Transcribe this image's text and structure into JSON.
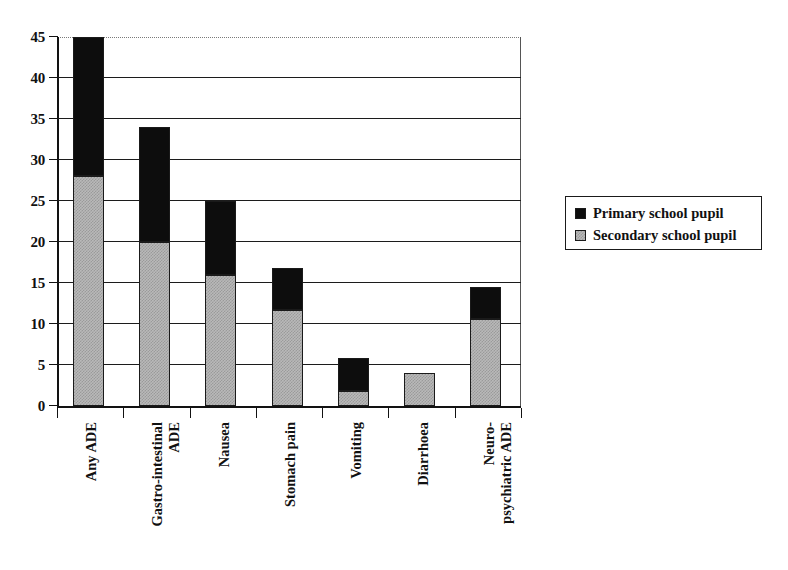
{
  "chart_data": {
    "type": "bar",
    "subtype": "stacked-vertical",
    "title": "",
    "xlabel": "",
    "ylabel": "",
    "ylim": [
      0,
      45
    ],
    "yticks": [
      0,
      5,
      10,
      15,
      20,
      25,
      30,
      35,
      40,
      45
    ],
    "ytick_labels": [
      "0",
      "5",
      "10",
      "15",
      "20",
      "25",
      "30",
      "35",
      "40",
      "45"
    ],
    "grid": true,
    "grid_axis": "y",
    "legend_position": "right",
    "categories": [
      "Any ADE",
      "Gastro-intestinal ADE",
      "Nausea",
      "Stomach pain",
      "Vomiting",
      "Diarrhoea",
      "Neuro-psychiatric ADE"
    ],
    "category_label_lines": [
      [
        "Any ADE"
      ],
      [
        "Gastro-intestinal",
        "ADE"
      ],
      [
        "Nausea"
      ],
      [
        "Stomach pain"
      ],
      [
        "Vomiting"
      ],
      [
        "Diarrhoea"
      ],
      [
        "Neuro-",
        "psychiatric ADE"
      ]
    ],
    "series": [
      {
        "name": "Secondary school pupil",
        "color": "#b9b9b9",
        "values": [
          28,
          20,
          16,
          11.7,
          1.8,
          4,
          10.6
        ]
      },
      {
        "name": "Primary school pupil",
        "color": "#0d0d0d",
        "values": [
          17,
          14,
          9,
          5.1,
          4,
          0,
          3.9
        ]
      }
    ],
    "totals": [
      45,
      34,
      25,
      16.8,
      5.8,
      4,
      14.5
    ],
    "stack_order": [
      "Secondary school pupil",
      "Primary school pupil"
    ]
  },
  "legend": {
    "items": [
      {
        "label": "Primary school pupil",
        "swatch": "primary"
      },
      {
        "label": "Secondary school pupil",
        "swatch": "secondary"
      }
    ]
  }
}
